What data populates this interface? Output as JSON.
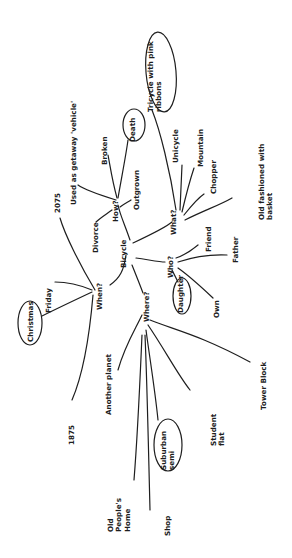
{
  "diagram": {
    "type": "mind-map",
    "orientation": "rotated -90deg (text reads bottom-to-top)",
    "central_topic": "Bicycle",
    "ink_color": "#1e1e1e",
    "background": "#ffffff",
    "branches": [
      {
        "label": "How?",
        "children": [
          "Used as getaway 'vehicle'",
          "Broken",
          "Death",
          "Outgrown",
          "Divorce"
        ],
        "circled": [
          "Death"
        ]
      },
      {
        "label": "What?",
        "children": [
          "Tricycle with pink ribbons",
          "Unicycle",
          "Mountain",
          "Chopper",
          "Old fashioned with basket"
        ],
        "circled": [
          "Tricycle with pink ribbons"
        ]
      },
      {
        "label": "Who?",
        "children": [
          "Friend",
          "Father",
          "Own",
          "Daughter"
        ],
        "circled": [
          "Daughter"
        ]
      },
      {
        "label": "When?",
        "children": [
          "2075",
          "Friday",
          "Christmas",
          "1875"
        ],
        "circled": [
          "Christmas"
        ]
      },
      {
        "label": "Where?",
        "children": [
          "Another planet",
          "Tower Block",
          "Student flat",
          "Suburban semi",
          "Shop",
          "Old People's Home"
        ],
        "circled": [
          "Suburban semi"
        ]
      }
    ]
  },
  "labels": {
    "bicycle": "Bicycle",
    "how": "How?",
    "what": "What?",
    "who": "Who?",
    "when": "When?",
    "where": "Where?",
    "used_as_getaway": "Used as getaway 'vehicle'",
    "broken": "Broken",
    "death": "Death",
    "outgrown": "Outgrown",
    "divorce": "Divorce",
    "tricycle_line1": "Tricycle with pink",
    "tricycle_line2": "ribbons",
    "unicycle": "Unicycle",
    "mountain": "Mountain",
    "chopper": "Chopper",
    "old_fashioned_line1": "Old fashioned with",
    "old_fashioned_line2": "basket",
    "friend": "Friend",
    "father": "Father",
    "own": "Own",
    "daughter": "Daughter",
    "y2075": "2075",
    "friday": "Friday",
    "christmas": "Christmas",
    "y1875": "1875",
    "another_planet": "Another planet",
    "tower_block": "Tower Block",
    "student_line1": "Student",
    "student_line2": "flat",
    "suburban_line1": "Suburban",
    "suburban_line2": "semi",
    "shop": "Shop",
    "old_people_line1": "Old",
    "old_people_line2": "People's",
    "old_people_line3": "Home"
  }
}
